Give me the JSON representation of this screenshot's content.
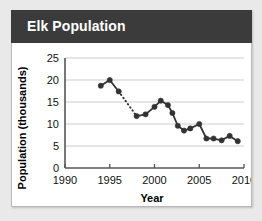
{
  "card": {
    "title": "Elk Population",
    "header_color": "#3b3b3b",
    "background_color": "#ffffff",
    "page_background": "#e9e9e9"
  },
  "chart_data": {
    "type": "line",
    "title": "Elk Population",
    "xlabel": "Year",
    "ylabel": "Population (thousands)",
    "xlim": [
      1990,
      2010
    ],
    "ylim": [
      0,
      25
    ],
    "xticks": [
      1990,
      1995,
      2000,
      2005,
      2010
    ],
    "yticks": [
      0,
      5,
      10,
      15,
      20,
      25
    ],
    "grid": "horizontal",
    "legend": "none",
    "marker": "filled-circle",
    "line_color": "#333333",
    "marker_color": "#333333",
    "gap_segment": {
      "from_x": 1996,
      "to_x": 1998,
      "style": "dotted"
    },
    "x": [
      1994,
      1995,
      1996,
      1998,
      1999,
      2000,
      2000.7,
      2001.5,
      2002,
      2002.6,
      2003.3,
      2004,
      2005,
      2005.8,
      2006.6,
      2007.5,
      2008.4,
      2009.3
    ],
    "values": [
      18.7,
      20.0,
      17.4,
      11.8,
      12.2,
      13.9,
      15.3,
      14.3,
      12.5,
      9.6,
      8.5,
      9.0,
      10.0,
      6.7,
      6.7,
      6.3,
      7.3,
      6.1
    ],
    "points": [
      {
        "x": 1994,
        "y": 18.7
      },
      {
        "x": 1995,
        "y": 20.0
      },
      {
        "x": 1996,
        "y": 17.4
      },
      {
        "x": 1998,
        "y": 11.8
      },
      {
        "x": 1999,
        "y": 12.2
      },
      {
        "x": 2000,
        "y": 13.9
      },
      {
        "x": 2000.7,
        "y": 15.3
      },
      {
        "x": 2001.5,
        "y": 14.3
      },
      {
        "x": 2002,
        "y": 12.5
      },
      {
        "x": 2002.6,
        "y": 9.6
      },
      {
        "x": 2003.3,
        "y": 8.5
      },
      {
        "x": 2004,
        "y": 9.0
      },
      {
        "x": 2005,
        "y": 10.0
      },
      {
        "x": 2005.8,
        "y": 6.7
      },
      {
        "x": 2006.6,
        "y": 6.7
      },
      {
        "x": 2007.5,
        "y": 6.3
      },
      {
        "x": 2008.4,
        "y": 7.3
      },
      {
        "x": 2009.3,
        "y": 6.1
      }
    ]
  }
}
